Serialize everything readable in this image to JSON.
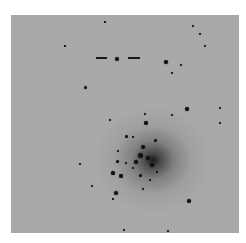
{
  "image": {
    "description": "Inverted grayscale astronomical image of a globular star cluster with a marked star",
    "background_color": "#a9a9a9",
    "star_color": "#111111"
  },
  "markers": [
    {
      "x": 96,
      "y": 57,
      "w": 11
    },
    {
      "x": 128,
      "y": 57,
      "w": 12
    }
  ],
  "stars": [
    {
      "x": 117,
      "y": 59,
      "r": 2.2
    },
    {
      "x": 166,
      "y": 62,
      "r": 1.8
    },
    {
      "x": 181,
      "y": 65,
      "r": 1.2
    },
    {
      "x": 172,
      "y": 73,
      "r": 1.2
    },
    {
      "x": 200,
      "y": 34,
      "r": 1.1
    },
    {
      "x": 205,
      "y": 46,
      "r": 1
    },
    {
      "x": 85,
      "y": 87,
      "r": 1.5
    },
    {
      "x": 187,
      "y": 109,
      "r": 1.8
    },
    {
      "x": 220,
      "y": 108,
      "r": 1.3
    },
    {
      "x": 220,
      "y": 123,
      "r": 1
    },
    {
      "x": 145,
      "y": 114,
      "r": 1.3
    },
    {
      "x": 146,
      "y": 123,
      "r": 1.7
    },
    {
      "x": 126,
      "y": 136,
      "r": 1.5
    },
    {
      "x": 133,
      "y": 137,
      "r": 1.2
    },
    {
      "x": 155,
      "y": 140,
      "r": 1.5
    },
    {
      "x": 118,
      "y": 151,
      "r": 1.3
    },
    {
      "x": 117,
      "y": 161,
      "r": 1.5
    },
    {
      "x": 126,
      "y": 163,
      "r": 1.2
    },
    {
      "x": 113,
      "y": 173,
      "r": 1.6
    },
    {
      "x": 121,
      "y": 176,
      "r": 1.8
    },
    {
      "x": 80,
      "y": 164,
      "r": 1.3
    },
    {
      "x": 92,
      "y": 186,
      "r": 1.3
    },
    {
      "x": 116,
      "y": 193,
      "r": 2.2
    },
    {
      "x": 113,
      "y": 199,
      "r": 1.2
    },
    {
      "x": 189,
      "y": 201,
      "r": 1.9
    },
    {
      "x": 143,
      "y": 189,
      "r": 1.4
    },
    {
      "x": 150,
      "y": 180,
      "r": 1.2
    },
    {
      "x": 133,
      "y": 168,
      "r": 1.4
    },
    {
      "x": 140,
      "y": 175,
      "r": 1.5
    },
    {
      "x": 143,
      "y": 147,
      "r": 2.2
    },
    {
      "x": 140,
      "y": 155,
      "r": 2.5
    },
    {
      "x": 148,
      "y": 158,
      "r": 2.2
    },
    {
      "x": 136,
      "y": 162,
      "r": 1.8
    },
    {
      "x": 152,
      "y": 165,
      "r": 1.6
    },
    {
      "x": 124,
      "y": 230,
      "r": 1
    },
    {
      "x": 168,
      "y": 231,
      "r": 1
    },
    {
      "x": 65,
      "y": 46,
      "r": 0.8
    },
    {
      "x": 105,
      "y": 22,
      "r": 0.8
    },
    {
      "x": 193,
      "y": 26,
      "r": 0.9
    },
    {
      "x": 172,
      "y": 115,
      "r": 1
    },
    {
      "x": 157,
      "y": 172,
      "r": 1.2
    },
    {
      "x": 110,
      "y": 120,
      "r": 0.9
    }
  ]
}
